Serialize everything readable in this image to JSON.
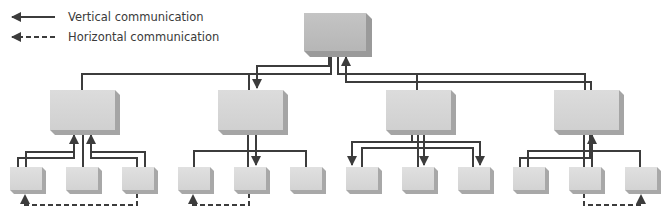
{
  "legend": {
    "vertical_label": "Vertical communication",
    "horizontal_label": "Horizontal communication"
  },
  "colors": {
    "line": "#3c3c3c",
    "box_top": "#cfcfcf",
    "box_top_main": "#bdbdbd",
    "box_side": "#9e9e9e",
    "box_bottom": "#8f8f8f",
    "background": "#ffffff"
  },
  "diagram": {
    "levels": 3,
    "top_node": "Top management",
    "middle_nodes": 4,
    "bottom_nodes_per_group": 3
  }
}
